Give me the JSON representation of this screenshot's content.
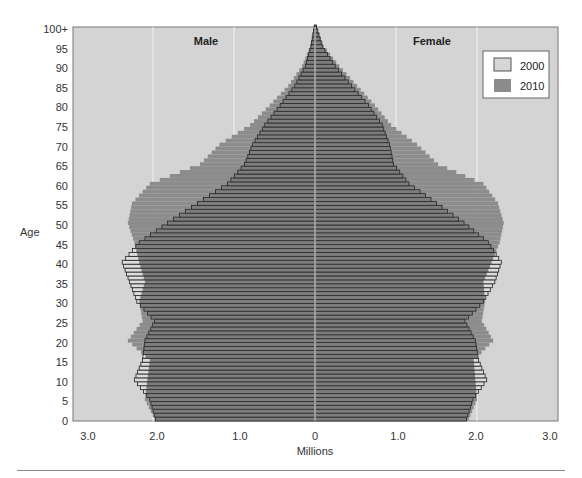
{
  "chart_data": {
    "type": "bar",
    "subtype": "population-pyramid",
    "title": "",
    "xlabel": "Millions",
    "ylabel": "Age",
    "xlim": [
      -3.0,
      3.0
    ],
    "ylim": [
      0,
      100
    ],
    "x_tick_labels": [
      "3.0",
      "2.0",
      "1.0",
      "0",
      "1.0",
      "2.0",
      "3.0"
    ],
    "y_tick_labels": [
      "0",
      "5",
      "10",
      "15",
      "20",
      "25",
      "30",
      "35",
      "40",
      "45",
      "50",
      "55",
      "60",
      "65",
      "70",
      "75",
      "80",
      "85",
      "90",
      "95",
      "100+"
    ],
    "panel_labels": {
      "left": "Male",
      "right": "Female"
    },
    "legend": [
      {
        "label": "2000",
        "color": "#d3d3d3",
        "style": "outlined"
      },
      {
        "label": "2010",
        "color": "#8c8c8c",
        "style": "filled"
      }
    ],
    "legend_position": "upper-right",
    "grid": true,
    "anchor_ages": [
      0,
      5,
      10,
      15,
      20,
      25,
      30,
      35,
      40,
      45,
      50,
      55,
      60,
      65,
      70,
      75,
      80,
      85,
      90,
      95,
      100
    ],
    "series": [
      {
        "name": "Male 2000",
        "sex": "male",
        "year": "2000",
        "values": [
          1.97,
          2.04,
          2.23,
          2.13,
          2.1,
          1.98,
          2.2,
          2.29,
          2.38,
          2.17,
          1.82,
          1.45,
          1.08,
          0.87,
          0.77,
          0.62,
          0.43,
          0.25,
          0.12,
          0.05,
          0.01
        ]
      },
      {
        "name": "Male 2010",
        "sex": "male",
        "year": "2010",
        "values": [
          1.98,
          2.1,
          2.07,
          2.04,
          2.31,
          2.13,
          2.17,
          2.1,
          2.17,
          2.23,
          2.31,
          2.26,
          2.04,
          1.42,
          1.18,
          0.8,
          0.56,
          0.33,
          0.16,
          0.06,
          0.01
        ]
      },
      {
        "name": "Female 2000",
        "sex": "female",
        "year": "2000",
        "values": [
          1.87,
          1.95,
          2.12,
          2.02,
          1.98,
          1.85,
          2.08,
          2.22,
          2.3,
          2.14,
          1.84,
          1.5,
          1.16,
          0.97,
          0.92,
          0.83,
          0.66,
          0.45,
          0.25,
          0.09,
          0.02
        ]
      },
      {
        "name": "Female 2010",
        "sex": "female",
        "year": "2010",
        "values": [
          1.9,
          2.0,
          1.98,
          1.96,
          2.2,
          2.06,
          2.1,
          2.08,
          2.18,
          2.28,
          2.33,
          2.26,
          2.08,
          1.52,
          1.26,
          0.94,
          0.74,
          0.52,
          0.3,
          0.11,
          0.02
        ]
      }
    ]
  }
}
